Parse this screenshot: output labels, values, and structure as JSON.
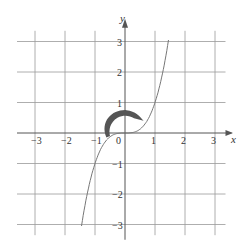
{
  "chart_data": {
    "type": "line",
    "title": "",
    "xlabel": "x",
    "ylabel": "y",
    "xlim": [
      -3.3,
      3.5
    ],
    "ylim": [
      -3.3,
      3.3
    ],
    "grid": true,
    "x_ticks": [
      "-3",
      "-2",
      "-1",
      "0",
      "1",
      "2",
      "3"
    ],
    "y_ticks": [
      "3",
      "2",
      "1",
      "-1",
      "-2",
      "-3"
    ],
    "series": [
      {
        "name": "y = x^3",
        "x": [
          -1.45,
          -1.2,
          -1.0,
          -0.8,
          -0.5,
          -0.25,
          0,
          0.25,
          0.5,
          0.8,
          1.0,
          1.2,
          1.45
        ],
        "values": [
          -3.05,
          -1.73,
          -1.0,
          -0.51,
          -0.125,
          -0.016,
          0,
          0.016,
          0.125,
          0.51,
          1.0,
          1.73,
          3.05
        ]
      }
    ],
    "annotations": [
      {
        "type": "curved-arrow",
        "description": "thick clockwise arc around origin from (-0.7,-0.1) over (0,0.7) to (0.6,0.4)"
      }
    ]
  },
  "labels": {
    "x_axis": "x",
    "y_axis": "y",
    "origin": "0"
  }
}
